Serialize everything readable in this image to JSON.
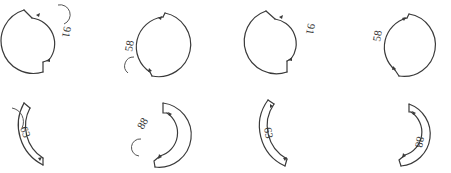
{
  "diagram": {
    "title": "",
    "colors": {
      "stroke": "#3a3a3a",
      "background": "#ffffff"
    },
    "figures": [
      {
        "id": "fig-1",
        "row": 1,
        "col": 1,
        "shape": "notched-circle",
        "label": "91",
        "label_side": "right"
      },
      {
        "id": "fig-2",
        "row": 1,
        "col": 2,
        "shape": "notched-circle",
        "label": "58",
        "label_side": "left"
      },
      {
        "id": "fig-3",
        "row": 1,
        "col": 3,
        "shape": "notched-circle",
        "label": "91",
        "label_side": "right"
      },
      {
        "id": "fig-4",
        "row": 1,
        "col": 4,
        "shape": "notched-circle",
        "label": "58",
        "label_side": "left"
      },
      {
        "id": "fig-5",
        "row": 2,
        "col": 1,
        "shape": "thick-arc",
        "label": "63",
        "label_side": "inside"
      },
      {
        "id": "fig-6",
        "row": 2,
        "col": 2,
        "shape": "thick-arc",
        "label": "88",
        "label_side": "left"
      },
      {
        "id": "fig-7",
        "row": 2,
        "col": 3,
        "shape": "thick-arc",
        "label": "63",
        "label_side": "inside"
      },
      {
        "id": "fig-8",
        "row": 2,
        "col": 4,
        "shape": "thick-arc",
        "label": "88",
        "label_side": "inside"
      }
    ]
  }
}
